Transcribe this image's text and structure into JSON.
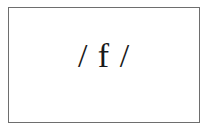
{
  "card": {
    "text": "/ f /"
  },
  "colors": {
    "border": "#6e6e6e",
    "text": "#1a1a1a",
    "background": "#ffffff"
  }
}
